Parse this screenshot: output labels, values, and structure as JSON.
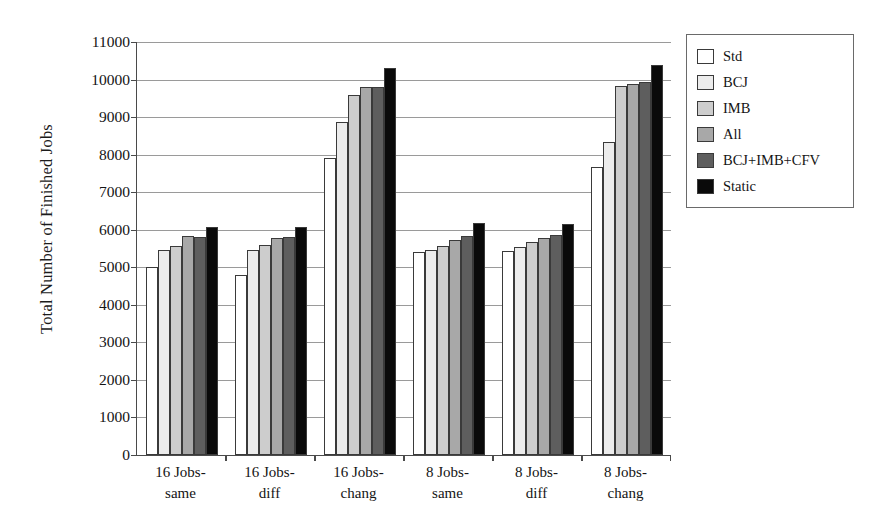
{
  "chart_data": {
    "type": "bar",
    "title": "",
    "xlabel": "",
    "ylabel": "Total Number of Finished Jobs",
    "ylim": [
      0,
      11000
    ],
    "ytick_step": 1000,
    "yticks": [
      11000,
      10000,
      9000,
      8000,
      7000,
      6000,
      5000,
      4000,
      3000,
      2000,
      1000,
      0
    ],
    "grid": true,
    "legend_position": "upper-right-outside",
    "categories": [
      "16 Jobs-same",
      "16 Jobs-diff",
      "16 Jobs-chang",
      "8 Jobs-same",
      "8 Jobs-diff",
      "8 Jobs-chang"
    ],
    "category_lines": [
      [
        "16 Jobs-",
        "same"
      ],
      [
        "16 Jobs-",
        "diff"
      ],
      [
        "16 Jobs-",
        "chang"
      ],
      [
        "8 Jobs-",
        "same"
      ],
      [
        "8 Jobs-",
        "diff"
      ],
      [
        "8 Jobs-",
        "chang"
      ]
    ],
    "series": [
      {
        "name": "Std",
        "color": "#ffffff",
        "values": [
          5000,
          4800,
          7900,
          5400,
          5440,
          7680
        ]
      },
      {
        "name": "BCJ",
        "color": "#ececec",
        "values": [
          5460,
          5450,
          8880,
          5460,
          5530,
          8340
        ]
      },
      {
        "name": "IMB",
        "color": "#cdcdcd",
        "values": [
          5570,
          5600,
          9580,
          5560,
          5670,
          9820
        ]
      },
      {
        "name": "All",
        "color": "#a8a8a8",
        "values": [
          5840,
          5790,
          9790,
          5730,
          5790,
          9890
        ]
      },
      {
        "name": "BCJ+IMB+CFV",
        "color": "#5e5e5e",
        "values": [
          5800,
          5800,
          9800,
          5830,
          5860,
          9930
        ]
      },
      {
        "name": "Static",
        "color": "#0a0a0a",
        "values": [
          6080,
          6080,
          10320,
          6180,
          6160,
          10380
        ]
      }
    ]
  }
}
